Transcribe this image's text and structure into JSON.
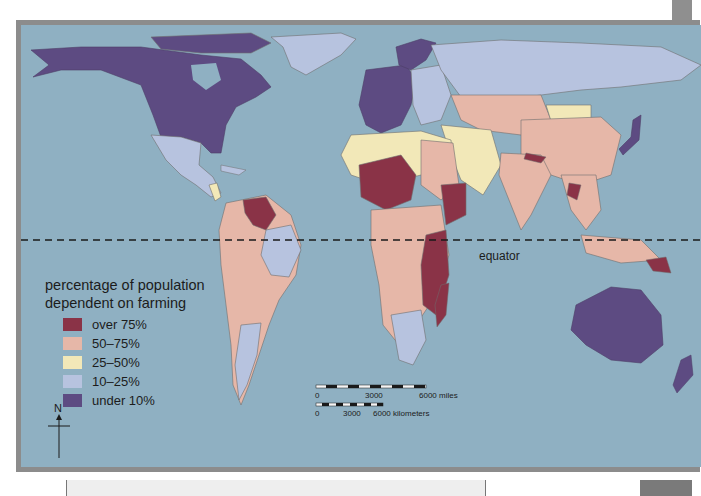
{
  "map": {
    "legend": {
      "title_line1": "percentage of population",
      "title_line2": "dependent on farming",
      "items": [
        {
          "label": "over 75%",
          "color": "#8a3347"
        },
        {
          "label": "50–75%",
          "color": "#e6b7a8"
        },
        {
          "label": "25–50%",
          "color": "#f2e8b8"
        },
        {
          "label": "10–25%",
          "color": "#b7c3df"
        },
        {
          "label": "under 10%",
          "color": "#5d4b82"
        }
      ]
    },
    "equator_label": "equator",
    "ocean_color": "#8fb0c2",
    "scale": {
      "miles": {
        "start": "0",
        "mid": "3000",
        "end": "6000 miles"
      },
      "km": {
        "start": "0",
        "mid": "3000",
        "end": "6000 kilometers"
      }
    },
    "compass": {
      "label": "N"
    }
  }
}
